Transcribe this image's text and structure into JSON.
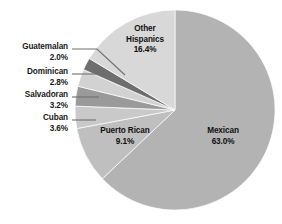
{
  "chart_data": {
    "type": "pie",
    "title": "",
    "subtitle": "",
    "xlabel": "",
    "ylabel": "",
    "legend_position": "none",
    "grid": false,
    "start_angle_deg": 0,
    "direction": "clockwise",
    "units": "percent",
    "categories": [
      "Mexican",
      "Puerto Rican",
      "Cuban",
      "Salvadoran",
      "Dominican",
      "Guatemalan",
      "Other Hispanics"
    ],
    "values": [
      63.0,
      9.1,
      3.6,
      3.2,
      2.8,
      2.0,
      16.4
    ],
    "slices": [
      {
        "label": "Mexican",
        "value": 63.0,
        "value_text": "63.0%",
        "color": "#b3b3b3",
        "label_placement": "inside"
      },
      {
        "label": "Puerto Rican",
        "value": 9.1,
        "value_text": "9.1%",
        "color": "#bfbfbf",
        "label_placement": "inside"
      },
      {
        "label": "Cuban",
        "value": 3.6,
        "value_text": "3.6%",
        "color": "#c9c9c9",
        "label_placement": "callout"
      },
      {
        "label": "Salvadoran",
        "value": 3.2,
        "value_text": "3.2%",
        "color": "#9a9a9a",
        "label_placement": "callout"
      },
      {
        "label": "Dominican",
        "value": 2.8,
        "value_text": "2.8%",
        "color": "#d2d2d2",
        "label_placement": "callout"
      },
      {
        "label": "Guatemalan",
        "value": 2.0,
        "value_text": "2.0%",
        "color": "#6e6e6e",
        "label_placement": "callout"
      },
      {
        "label": "Other Hispanics",
        "value": 16.4,
        "value_text": "16.4%",
        "color": "#d8d8d8",
        "label_placement": "inside"
      }
    ]
  },
  "labels": {
    "guatemalan": {
      "name": "Guatemalan",
      "pct": "2.0%"
    },
    "dominican": {
      "name": "Dominican",
      "pct": "2.8%"
    },
    "salvadoran": {
      "name": "Salvadoran",
      "pct": "3.2%"
    },
    "cuban": {
      "name": "Cuban",
      "pct": "3.6%"
    },
    "other_hispanics": {
      "name_line1": "Other",
      "name_line2": "Hispanics",
      "pct": "16.4%"
    },
    "puerto_rican": {
      "name": "Puerto Rican",
      "pct": "9.1%"
    },
    "mexican": {
      "name": "Mexican",
      "pct": "63.0%"
    }
  },
  "colors": {
    "background": "#ffffff",
    "text": "#1a1a1a",
    "leader_line": "#6f6f6f"
  }
}
